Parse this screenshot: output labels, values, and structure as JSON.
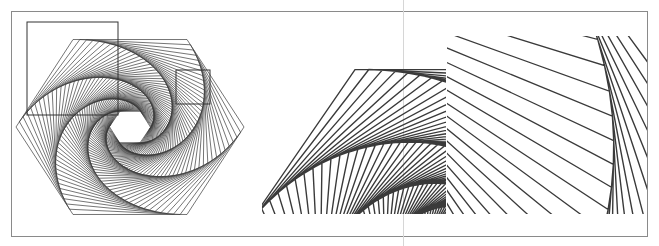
{
  "figure": {
    "stroke_color": "#3a3a3a",
    "box_color": "#333333",
    "frame_color": "#8a8a8a"
  },
  "hexagon": {
    "center": [
      130,
      127
    ],
    "radius_x": 114,
    "radius_y": 101,
    "sides": 6,
    "iterations": 60,
    "twist_t": 0.06
  },
  "highlight_boxes": [
    {
      "name": "detail-box-large",
      "x": 27,
      "y": 22,
      "width": 91,
      "height": 93
    },
    {
      "name": "detail-box-small",
      "x": 176,
      "y": 70,
      "width": 34,
      "height": 34
    }
  ],
  "insets": [
    {
      "name": "inset-large",
      "source_box": 0,
      "x": 262,
      "y": 36,
      "width": 184,
      "height": 178
    },
    {
      "name": "inset-small",
      "source_box": 1,
      "x": 447,
      "y": 36,
      "width": 200,
      "height": 178
    }
  ]
}
